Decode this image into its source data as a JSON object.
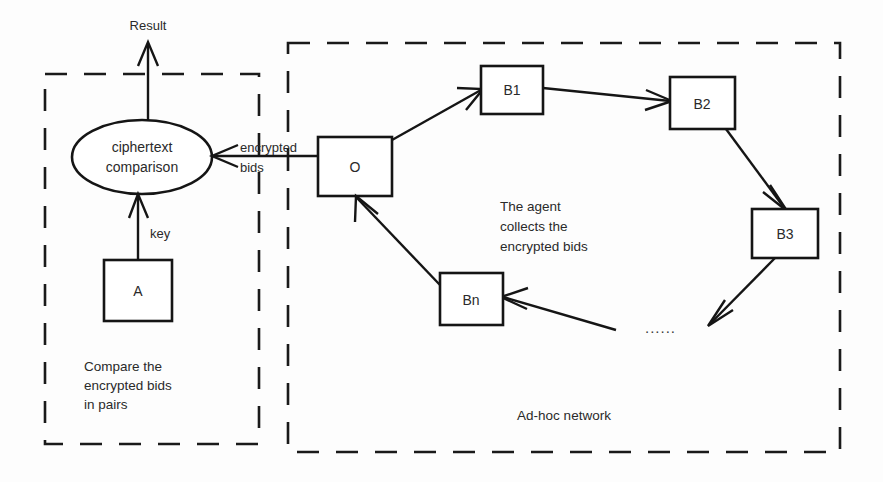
{
  "diagram": {
    "background_color": "#fdfdfd",
    "stroke_color": "#151515"
  },
  "zones": [
    {
      "id": "comparison-zone",
      "label": "Compare the\nencrypted bids\nin pairs",
      "label_lines": [
        "Compare the",
        "encrypted bids",
        "in pairs"
      ],
      "style": "dashed"
    },
    {
      "id": "network-zone",
      "label": "Ad-hoc network",
      "style": "dashed"
    }
  ],
  "nodes": {
    "ciphertext_comparison": {
      "label_lines": [
        "ciphertext",
        "comparison"
      ],
      "shape": "ellipse"
    },
    "a": {
      "label": "A",
      "shape": "rect"
    },
    "o": {
      "label": "O",
      "shape": "rect"
    },
    "b1": {
      "label": "B1",
      "shape": "rect"
    },
    "b2": {
      "label": "B2",
      "shape": "rect"
    },
    "b3": {
      "label": "B3",
      "shape": "rect"
    },
    "bn": {
      "label": "Bn",
      "shape": "rect"
    },
    "ellipsis": {
      "label": "......",
      "shape": "text"
    }
  },
  "edges": {
    "result": {
      "label": "Result",
      "from": "ciphertext_comparison",
      "to": "outside"
    },
    "key": {
      "label": "key",
      "from": "a",
      "to": "ciphertext_comparison"
    },
    "encrypted_bids": {
      "label_lines": [
        "encrypted",
        "bids"
      ],
      "from": "o",
      "to": "ciphertext_comparison"
    },
    "o_to_b1": {
      "label": "",
      "from": "o",
      "to": "b1"
    },
    "b1_to_b2": {
      "label": "",
      "from": "b1",
      "to": "b2"
    },
    "b2_to_b3": {
      "label": "",
      "from": "b2",
      "to": "b3"
    },
    "b3_to_next": {
      "label": "",
      "from": "b3",
      "to": "ellipsis"
    },
    "prev_to_bn": {
      "label": "",
      "from": "ellipsis",
      "to": "bn"
    },
    "bn_to_o": {
      "label": "",
      "from": "bn",
      "to": "o"
    }
  },
  "annotations": {
    "agent": {
      "label_lines": [
        "The agent",
        "collects the",
        "encrypted bids"
      ]
    }
  }
}
